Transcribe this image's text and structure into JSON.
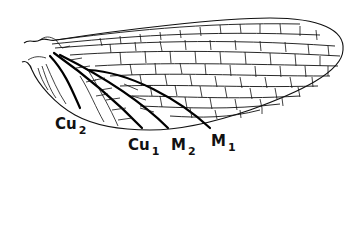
{
  "figure": {
    "labels": [
      {
        "id": "cu2",
        "base": "Cu",
        "sub": "2",
        "x": 55,
        "y": 117
      },
      {
        "id": "cu1",
        "base": "Cu",
        "sub": "1",
        "x": 128,
        "y": 138
      },
      {
        "id": "m2",
        "base": "M",
        "sub": "2",
        "x": 171,
        "y": 138
      },
      {
        "id": "m1",
        "base": "M",
        "sub": "1",
        "x": 211,
        "y": 134
      }
    ],
    "colors": {
      "ink": "#111111",
      "background": "#ffffff"
    }
  }
}
